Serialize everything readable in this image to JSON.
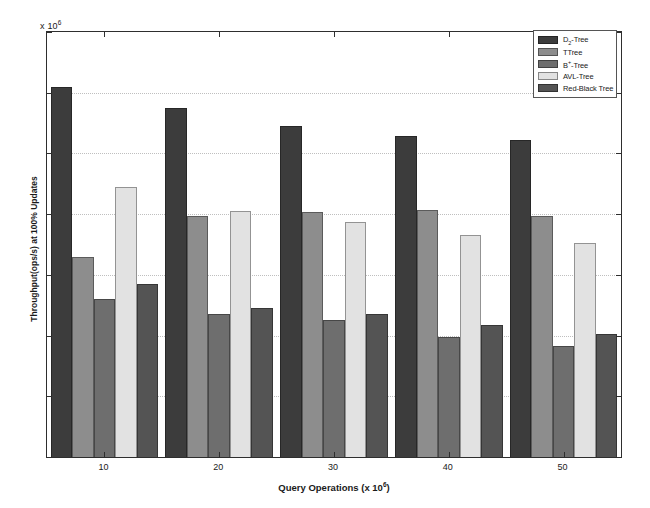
{
  "chart_data": {
    "type": "bar",
    "title": "",
    "xlabel": "Query Operations (x 10",
    "xlabel_exp": "6",
    "xlabel_close": ")",
    "ylabel": "Throughput(ops/s) at 100% Updates",
    "y_exponent_prefix": "x 10",
    "y_exponent_power": "6",
    "categories": [
      "10",
      "20",
      "30",
      "40",
      "50"
    ],
    "ylim": [
      0,
      7
    ],
    "yticks": [
      0,
      1,
      2,
      3,
      4,
      5,
      6,
      7
    ],
    "ytick_labels": [
      "0",
      "1",
      "2",
      "3",
      "4",
      "5",
      "6",
      "7"
    ],
    "grid": true,
    "legend_position": "top-right",
    "series": [
      {
        "name": "D",
        "name_sub": "2",
        "name_rest": "-Tree",
        "label": "D2-Tree",
        "color": "#3c3c3c",
        "values": [
          6.1,
          5.75,
          5.45,
          5.28,
          5.22
        ]
      },
      {
        "name": "T",
        "name_sub": "",
        "name_rest": "Tree",
        "label": "TTree",
        "color": "#8d8d8d",
        "values": [
          3.3,
          3.97,
          4.03,
          4.07,
          3.97
        ]
      },
      {
        "name": "B",
        "name_sup": "+",
        "name_rest": "-Tree",
        "label": "B+-Tree",
        "color": "#6e6e6e",
        "values": [
          2.6,
          2.35,
          2.25,
          1.97,
          1.83
        ]
      },
      {
        "name": "AVL",
        "name_rest": "-Tree",
        "label": "AVL-Tree",
        "color": "#e2e2e2",
        "values": [
          4.45,
          4.05,
          3.87,
          3.65,
          3.52
        ]
      },
      {
        "name": "Red-Black Tree",
        "name_rest": "",
        "label": "Red-Black Tree",
        "color": "#545454",
        "values": [
          2.85,
          2.45,
          2.35,
          2.17,
          2.03
        ]
      }
    ]
  },
  "legend": {
    "items": [
      {
        "label_main": "D",
        "label_sub": "2",
        "label_tail": "-Tree"
      },
      {
        "label_main": "T",
        "label_sub": "",
        "label_tail": "Tree"
      },
      {
        "label_main": "B",
        "label_sup": "+",
        "label_tail": "-Tree"
      },
      {
        "label_main": "AVL",
        "label_sub": "",
        "label_tail": "-Tree"
      },
      {
        "label_main": "Red-Black Tree",
        "label_sub": "",
        "label_tail": ""
      }
    ]
  }
}
